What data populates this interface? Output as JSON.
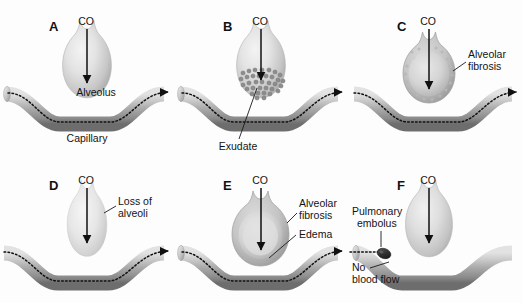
{
  "figure": {
    "background_color": "#fdfdfd",
    "width": 522,
    "height": 303
  },
  "colors": {
    "alveolus_light": "#eeeeee",
    "alveolus_mid": "#c9c9c9",
    "alveolus_dark": "#9e9e9e",
    "capillary_light": "#d8d8d8",
    "capillary_mid": "#a8a8a8",
    "capillary_dark": "#6f6f6f",
    "flow_line": "#111111",
    "text": "#141414",
    "embolus": "#2a2a2a",
    "exudate": "#8d8d8d"
  },
  "panels": [
    {
      "id": "A",
      "letter": "A",
      "condition": "normal",
      "labels": [
        {
          "name": "co-label",
          "text": "CO"
        },
        {
          "name": "alveolus-label",
          "text": "Alveolus"
        },
        {
          "name": "capillary-label",
          "text": "Capillary"
        }
      ]
    },
    {
      "id": "B",
      "letter": "B",
      "condition": "exudate-filled alveolus",
      "exudate_dot_count": 34,
      "labels": [
        {
          "name": "co-label",
          "text": "CO"
        },
        {
          "name": "exudate-label",
          "text": "Exudate"
        }
      ]
    },
    {
      "id": "C",
      "letter": "C",
      "condition": "alveolar fibrosis",
      "labels": [
        {
          "name": "co-label",
          "text": "CO"
        },
        {
          "name": "alveolar-fibrosis-label-line1",
          "text": "Alveolar"
        },
        {
          "name": "alveolar-fibrosis-label-line2",
          "text": "fibrosis"
        }
      ]
    },
    {
      "id": "D",
      "letter": "D",
      "condition": "loss of alveoli (emphysema)",
      "labels": [
        {
          "name": "co-label",
          "text": "CO"
        },
        {
          "name": "loss-of-alveoli-label-line1",
          "text": "Loss of"
        },
        {
          "name": "loss-of-alveoli-label-line2",
          "text": "alveoli"
        }
      ]
    },
    {
      "id": "E",
      "letter": "E",
      "condition": "alveolar fibrosis with edema",
      "labels": [
        {
          "name": "co-label",
          "text": "CO"
        },
        {
          "name": "alveolar-fibrosis-label-line1",
          "text": "Alveolar"
        },
        {
          "name": "alveolar-fibrosis-label-line2",
          "text": "fibrosis"
        },
        {
          "name": "edema-label",
          "text": "Edema"
        }
      ]
    },
    {
      "id": "F",
      "letter": "F",
      "condition": "pulmonary embolus blocking capillary",
      "labels": [
        {
          "name": "co-label",
          "text": "CO"
        },
        {
          "name": "pulmonary-embolus-label-line1",
          "text": "Pulmonary"
        },
        {
          "name": "pulmonary-embolus-label-line2",
          "text": "embolus"
        },
        {
          "name": "no-blood-flow-label-line1",
          "text": "No"
        },
        {
          "name": "no-blood-flow-label-line2",
          "text": "blood flow"
        }
      ]
    }
  ],
  "panel_a": {
    "letter": "A",
    "co": "CO",
    "alveolus": "Alveolus",
    "capillary": "Capillary"
  },
  "panel_b": {
    "letter": "B",
    "co": "CO",
    "exudate": "Exudate"
  },
  "panel_c": {
    "letter": "C",
    "co": "CO",
    "fibrosis1": "Alveolar",
    "fibrosis2": "fibrosis"
  },
  "panel_d": {
    "letter": "D",
    "co": "CO",
    "loss1": "Loss of",
    "loss2": "alveoli"
  },
  "panel_e": {
    "letter": "E",
    "co": "CO",
    "fibrosis1": "Alveolar",
    "fibrosis2": "fibrosis",
    "edema": "Edema"
  },
  "panel_f": {
    "letter": "F",
    "co": "CO",
    "embolus1": "Pulmonary",
    "embolus2": "embolus",
    "noflow1": "No",
    "noflow2": "blood flow"
  }
}
